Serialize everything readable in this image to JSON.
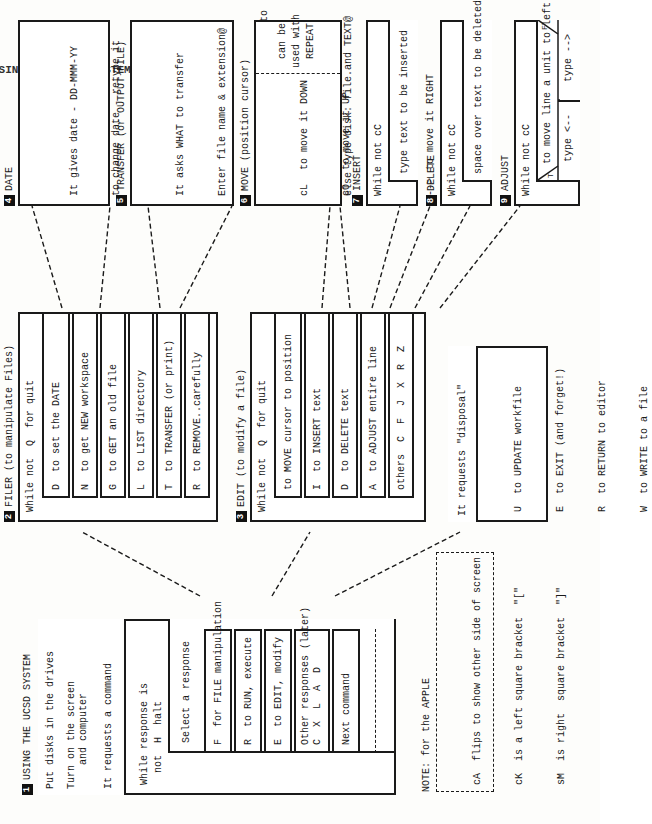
{
  "page": {
    "header_clipped": "USING THE FILE SYSTEM"
  },
  "section1": {
    "number": "1",
    "title": "USING THE UCSD SYSTEM",
    "steps": [
      "Put disks in the drives",
      "Turn on the screen\n    and computer",
      "It requests a command"
    ],
    "loop_condition": "While response is\n  not  H  halt",
    "select_label": "Select a response",
    "options": [
      "F  for FILE manipulation",
      "R  to RUN, execute",
      "E  to EDIT, modify",
      "Other responses (later)\nC  X  L  A  D"
    ],
    "next": "Next command"
  },
  "section2": {
    "number": "2",
    "title": "FILER (to manipulate Files)",
    "loop_condition": "While not  Q  for quit",
    "options": [
      "D  to set the DATE",
      "N  to get NEW workspace",
      "G  to GET an old file",
      "L  to LIST directory",
      "T  to TRANSFER (or print)",
      "R  to REMOVE..carefully"
    ]
  },
  "section3": {
    "number": "3",
    "title": "EDIT (to modify a file)",
    "loop_condition": "While not  Q  for quit",
    "options": [
      "to MOVE cursor to position",
      "I  to INSERT text",
      "D  to DELETE text",
      "A  to ADJUST entire line",
      "others  C  F  J  X  R  Z"
    ],
    "disposal_label": "It requests \"disposal\"",
    "disposal_options": [
      "U  to UPDATE workfile",
      "E  to EXIT (and forget!)",
      "R  to RETURN to editor",
      "W  to WRITE to a file"
    ]
  },
  "section4": {
    "number": "4",
    "title": "DATE",
    "lines": [
      "It gives date - DD-MMM-YY",
      "to change date - retype it",
      "to finish type @  (return)"
    ]
  },
  "section5": {
    "number": "5",
    "title": "TRANSFER (or OUTPUT FILE)",
    "lines": [
      "It asks WHAT to transfer",
      "Enter file name & extension@",
      "It asks WHERE to transfer it to",
      "If output type PRINTER:@",
      "else type disk: file.and TEXT@"
    ]
  },
  "section6": {
    "number": "6",
    "title": "MOVE (position cursor)",
    "keys": [
      "cL",
      "cO",
      "<--",
      "-->"
    ],
    "actions": [
      "to move it DOWN",
      "to move it UP",
      "to move it LEFT",
      "to move it RIGHT"
    ],
    "note": "can be\nused with\nREPEAT"
  },
  "section7": {
    "number": "7",
    "title": "INSERT",
    "loop_condition": "While not cC",
    "action": "type text to be inserted"
  },
  "section8": {
    "number": "8",
    "title": "DELETE",
    "loop_condition": "While not cC",
    "action": "space over text to be deleted"
  },
  "section9": {
    "number": "9",
    "title": "ADJUST",
    "loop_condition": "While not cC",
    "condition": "to move line a unit to left",
    "true_label": "T",
    "false_label": "F",
    "true_action": "type <--",
    "false_action": "type -->"
  },
  "note": {
    "title": "NOTE: for the APPLE",
    "lines": [
      "cA  flips to show other side of screen",
      "cK  is a left square bracket  \"[\"",
      "sM  is right  square bracket  \"]\""
    ]
  }
}
